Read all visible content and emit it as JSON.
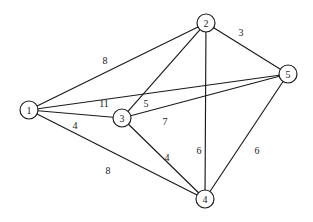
{
  "diagram": {
    "type": "weighted-undirected-graph",
    "title": "",
    "canvas": {
      "width": 313,
      "height": 222
    },
    "style": {
      "background_color": "#ffffff",
      "stroke_color": "#1a1a1a",
      "node_fill_color": "#ffffff",
      "node_radius": 9
    },
    "nodes": [
      {
        "id": "1",
        "label": "1",
        "x": 29,
        "y": 110
      },
      {
        "id": "2",
        "label": "2",
        "x": 206,
        "y": 23
      },
      {
        "id": "3",
        "label": "3",
        "x": 122,
        "y": 118
      },
      {
        "id": "4",
        "label": "4",
        "x": 205,
        "y": 199
      },
      {
        "id": "5",
        "label": "5",
        "x": 288,
        "y": 74
      }
    ],
    "edges": [
      {
        "id": "e12",
        "from": "1",
        "to": "2",
        "weight": "8",
        "label_x": 105,
        "label_y": 60
      },
      {
        "id": "e15",
        "from": "1",
        "to": "5",
        "weight": "11",
        "label_x": 104,
        "label_y": 103
      },
      {
        "id": "e13",
        "from": "1",
        "to": "3",
        "weight": "4",
        "label_x": 75,
        "label_y": 125
      },
      {
        "id": "e14",
        "from": "1",
        "to": "4",
        "weight": "8",
        "label_x": 108,
        "label_y": 170
      },
      {
        "id": "e23",
        "from": "2",
        "to": "3",
        "weight": "5",
        "label_x": 146,
        "label_y": 103
      },
      {
        "id": "e24",
        "from": "2",
        "to": "4",
        "weight": "6",
        "label_x": 199,
        "label_y": 150
      },
      {
        "id": "e25",
        "from": "2",
        "to": "5",
        "weight": "3",
        "label_x": 241,
        "label_y": 32
      },
      {
        "id": "e35",
        "from": "3",
        "to": "5",
        "weight": "7",
        "label_x": 165,
        "label_y": 121
      },
      {
        "id": "e34",
        "from": "3",
        "to": "4",
        "weight": "4",
        "label_x": 167,
        "label_y": 157
      },
      {
        "id": "e45",
        "from": "4",
        "to": "5",
        "weight": "6",
        "label_x": 257,
        "label_y": 150
      }
    ]
  }
}
